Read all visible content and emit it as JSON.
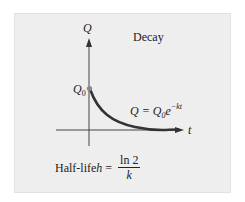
{
  "panel": {
    "background": "#eeeeee",
    "border": "#e2e2e2"
  },
  "diagram": {
    "title": "Decay",
    "y_axis_label": "Q",
    "x_axis_label": "t",
    "initial_value_label": "Q",
    "initial_value_subscript": "0",
    "curve_color": "#333333",
    "point_color": "#888888",
    "formula": {
      "lhs": "Q = Q",
      "subscript": "0",
      "base": "e",
      "exponent": "−kt"
    },
    "half_life": {
      "prefix": "Half-life ",
      "variable": "h",
      "equals": " = ",
      "numerator": "ln 2",
      "denominator": "k"
    }
  }
}
